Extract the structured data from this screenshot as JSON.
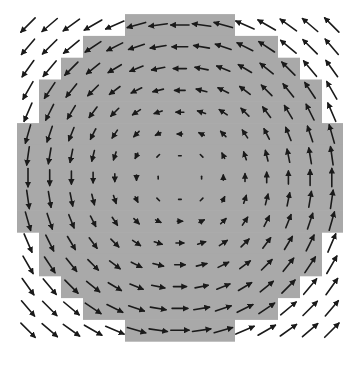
{
  "figure": {
    "type": "vector_field",
    "grid": {
      "cols": 15,
      "rows": 15,
      "x0": 28,
      "y0": 25,
      "dx": 21.7,
      "dy": 21.8
    },
    "rotation": "counter-clockwise",
    "colors": {
      "background": "#ffffff",
      "region": "#a9a9a9",
      "arrow": "#1a1a1a"
    },
    "region_rows": [
      {
        "row": 0,
        "x_start": 125,
        "x_end": 235
      },
      {
        "row": 1,
        "x_start": 83,
        "x_end": 278
      },
      {
        "row": 2,
        "x_start": 61,
        "x_end": 300
      },
      {
        "row": 3,
        "x_start": 39,
        "x_end": 322
      },
      {
        "row": 4,
        "x_start": 39,
        "x_end": 322
      },
      {
        "row": 5,
        "x_start": 17,
        "x_end": 343
      },
      {
        "row": 6,
        "x_start": 17,
        "x_end": 343
      },
      {
        "row": 7,
        "x_start": 17,
        "x_end": 343
      },
      {
        "row": 8,
        "x_start": 17,
        "x_end": 343
      },
      {
        "row": 9,
        "x_start": 17,
        "x_end": 343
      },
      {
        "row": 10,
        "x_start": 39,
        "x_end": 322
      },
      {
        "row": 11,
        "x_start": 39,
        "x_end": 322
      },
      {
        "row": 12,
        "x_start": 61,
        "x_end": 300
      },
      {
        "row": 13,
        "x_start": 83,
        "x_end": 278
      },
      {
        "row": 14,
        "x_start": 125,
        "x_end": 235
      }
    ],
    "arrow_scale": 2.6,
    "max_arrow_length": 20
  }
}
